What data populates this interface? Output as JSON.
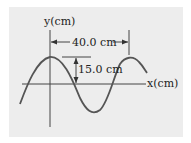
{
  "diagram": {
    "type": "transverse-wave",
    "axes": {
      "y_label": "y(cm)",
      "x_label": "x(cm)"
    },
    "annotations": {
      "wavelength_label": "40.0 cm",
      "amplitude_label": "15.0 cm"
    },
    "colors": {
      "panel": "#ededed",
      "wave": "#555555",
      "axis": "#444444"
    }
  }
}
